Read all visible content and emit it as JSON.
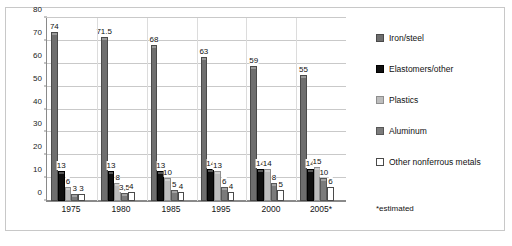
{
  "chart_data": {
    "type": "bar",
    "title": "",
    "xlabel": "",
    "ylabel": "",
    "ylim": [
      0,
      80
    ],
    "yticks": [
      0,
      10,
      20,
      30,
      40,
      50,
      60,
      70,
      80
    ],
    "grid": true,
    "legend_position": "right",
    "categories": [
      "1975",
      "1980",
      "1985",
      "1995",
      "2000",
      "2005*"
    ],
    "series": [
      {
        "name": "Iron/steel",
        "color": "#6e6e6e",
        "values": [
          74,
          71.5,
          68,
          63,
          59,
          55
        ],
        "labels": [
          "74",
          "71.5",
          "68",
          "63",
          "59",
          "55"
        ]
      },
      {
        "name": "Elastomers/other",
        "color": "#101010",
        "values": [
          13,
          13,
          13,
          14,
          14,
          14
        ],
        "labels": [
          "13",
          "13",
          "13",
          "14",
          "14",
          "14"
        ]
      },
      {
        "name": "Plastics",
        "color": "#bdbdbd",
        "values": [
          6,
          8,
          10,
          13,
          14,
          15
        ],
        "labels": [
          "6",
          "8",
          "10",
          "13",
          "14",
          "15"
        ]
      },
      {
        "name": "Aluminum",
        "color": "#7b7b7b",
        "values": [
          3,
          3.5,
          5,
          6,
          8,
          10
        ],
        "labels": [
          "3",
          "3,5",
          "5",
          "6",
          "8",
          "10"
        ]
      },
      {
        "name": "Other nonferrous metals",
        "color": "#ffffff",
        "values": [
          3,
          4,
          4,
          4,
          5,
          6
        ],
        "labels": [
          "3",
          "4",
          "4",
          "4",
          "5",
          "6"
        ]
      }
    ],
    "footnote": "*estimated"
  },
  "legend": {
    "items": [
      {
        "label": "Iron/steel",
        "swatch": "s-iron"
      },
      {
        "label": "Elastomers/other",
        "swatch": "s-elast"
      },
      {
        "label": "Plastics",
        "swatch": "s-plastic"
      },
      {
        "label": "Aluminum",
        "swatch": "s-alum"
      },
      {
        "label": "Other nonferrous metals",
        "swatch": "s-other"
      }
    ]
  },
  "footnote": "*estimated",
  "caption": ""
}
